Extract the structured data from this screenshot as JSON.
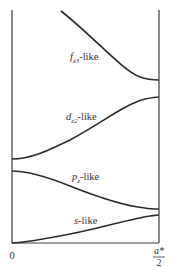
{
  "diagram": {
    "type": "band-structure",
    "colors": {
      "line": "#2a2a2a",
      "text": "#333333",
      "axis": "#3a3a3a"
    },
    "x_axis": {
      "start_label": "0",
      "end_label_numerator": "a*",
      "end_label_denominator": "2"
    },
    "bands": [
      {
        "id": "f",
        "label_main": "f",
        "label_sub": "z3",
        "label_suffix": "-like",
        "trend": "decreasing"
      },
      {
        "id": "d",
        "label_main": "d",
        "label_sub": "z2",
        "label_suffix": "-like",
        "trend": "increasing"
      },
      {
        "id": "p",
        "label_main": "p",
        "label_sub": "z",
        "label_suffix": "-like",
        "trend": "decreasing"
      },
      {
        "id": "s",
        "label_main": "s",
        "label_sub": "",
        "label_suffix": "-like",
        "trend": "increasing"
      }
    ]
  }
}
